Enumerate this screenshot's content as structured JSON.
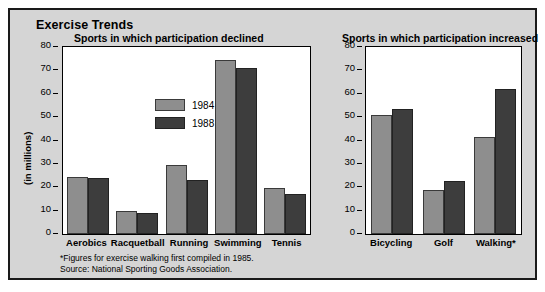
{
  "title": "Exercise Trends",
  "axis_title": "(in millions)",
  "legend": [
    {
      "label": "1984",
      "color": "#8e8e8e"
    },
    {
      "label": "1988",
      "color": "#3d3d3d"
    }
  ],
  "panels": {
    "left": {
      "title": "Sports in which participation declined"
    },
    "right": {
      "title": "Sports in which participation increased"
    }
  },
  "footnotes": [
    "*Figures for exercise walking first compiled in 1985.",
    "Source: National Sporting Goods Association."
  ],
  "ticks": [
    "80",
    "70",
    "60",
    "50",
    "40",
    "30",
    "20",
    "10",
    "0"
  ],
  "chart_data": [
    {
      "type": "bar",
      "title": "Sports in which participation declined",
      "xlabel": "",
      "ylabel": "(in millions)",
      "ylim": [
        0,
        80
      ],
      "yticks": [
        0,
        10,
        20,
        30,
        40,
        50,
        60,
        70,
        80
      ],
      "grid": false,
      "legend_position": "inside-upper-left",
      "categories": [
        "Aerobics",
        "Racquetball",
        "Running",
        "Swimming",
        "Tennis"
      ],
      "series": [
        {
          "name": "1984",
          "color": "#8e8e8e",
          "values": [
            24.5,
            10.0,
            29.5,
            74.5,
            19.5
          ]
        },
        {
          "name": "1988",
          "color": "#3d3d3d",
          "values": [
            24.0,
            9.0,
            23.0,
            71.0,
            17.0
          ]
        }
      ]
    },
    {
      "type": "bar",
      "title": "Sports in which participation increased",
      "xlabel": "",
      "ylabel": "",
      "ylim": [
        0,
        80
      ],
      "yticks": [
        0,
        10,
        20,
        30,
        40,
        50,
        60,
        70,
        80
      ],
      "grid": false,
      "legend_position": "none",
      "categories": [
        "Bicycling",
        "Golf",
        "Walking*"
      ],
      "series": [
        {
          "name": "1984",
          "color": "#8e8e8e",
          "values": [
            51.0,
            19.0,
            41.5
          ]
        },
        {
          "name": "1988",
          "color": "#3d3d3d",
          "values": [
            53.5,
            22.5,
            62.0
          ]
        }
      ]
    }
  ]
}
